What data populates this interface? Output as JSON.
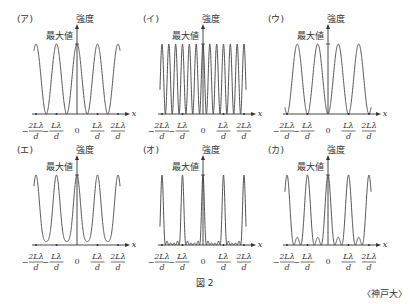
{
  "figure": {
    "caption": "図 2",
    "source": "〈神戸大〉",
    "y_label": "強度",
    "max_label": "最大値",
    "x_label": "x",
    "ticks": [
      "-2Lλ/d",
      "-Lλ/d",
      "0",
      "Lλ/d",
      "2Lλ/d"
    ],
    "ticks_display": {
      "neg2_num": "2Lλ",
      "neg1_num": "Lλ",
      "zero": "0",
      "pos1_num": "Lλ",
      "pos2_num": "2Lλ",
      "den": "d",
      "minus": "−"
    }
  },
  "panels": [
    {
      "id": "a",
      "label": "(ア)",
      "description": "cos² fringes, period Lλ/d, max at 0"
    },
    {
      "id": "i",
      "label": "(イ)",
      "description": "dense fringes, period Lλ/(3d), all equal maxima"
    },
    {
      "id": "u",
      "label": "(ウ)",
      "description": "fringes period Lλ/d, maxima shifted by half period (min at 0)"
    },
    {
      "id": "e",
      "label": "(エ)",
      "description": "main maxima at multiples of Lλ/d with one strong sidelobe pair"
    },
    {
      "id": "o",
      "label": "(オ)",
      "description": "sharp principal maxima with small subsidiary maxima"
    },
    {
      "id": "ka",
      "label": "(カ)",
      "description": "principal maxima with two secondary peaks of ~40% between"
    }
  ],
  "chart_data": [
    {
      "type": "line",
      "title": "(ア)",
      "xlabel": "x",
      "ylabel": "強度",
      "x_ticks": [
        "-2Lλ/d",
        "-Lλ/d",
        "0",
        "Lλ/d",
        "2Lλ/d"
      ],
      "pattern": "I = cos²(π x d / Lλ)",
      "maxima_x": [
        -2,
        -1,
        0,
        1,
        2
      ],
      "minima_x": [
        -1.5,
        -0.5,
        0.5,
        1.5
      ],
      "ymax": "最大値"
    },
    {
      "type": "line",
      "title": "(イ)",
      "xlabel": "x",
      "ylabel": "強度",
      "x_ticks": [
        "-2Lλ/d",
        "-Lλ/d",
        "0",
        "Lλ/d",
        "2Lλ/d"
      ],
      "pattern": "equal narrow fringes, ~13 peaks across range",
      "ymax": "最大値"
    },
    {
      "type": "line",
      "title": "(ウ)",
      "xlabel": "x",
      "ylabel": "強度",
      "x_ticks": [
        "-2Lλ/d",
        "-Lλ/d",
        "0",
        "Lλ/d",
        "2Lλ/d"
      ],
      "pattern": "I = sin²(π x d / Lλ)",
      "maxima_x": [
        -1.5,
        -0.5,
        0.5,
        1.5
      ],
      "minima_x": [
        -2,
        -1,
        0,
        1,
        2
      ],
      "ymax": "最大値"
    },
    {
      "type": "line",
      "title": "(エ)",
      "xlabel": "x",
      "ylabel": "強度",
      "x_ticks": [
        "-2Lλ/d",
        "-Lλ/d",
        "0",
        "Lλ/d",
        "2Lλ/d"
      ],
      "pattern": "principal maxima at integers, secondary maxima ~0.55 of max, zeros at ±0.5, ±1.5",
      "ymax": "最大値"
    },
    {
      "type": "line",
      "title": "(オ)",
      "xlabel": "x",
      "ylabel": "強度",
      "x_ticks": [
        "-2Lλ/d",
        "-Lλ/d",
        "0",
        "Lλ/d",
        "2Lλ/d"
      ],
      "pattern": "sharp principal maxima at integers, tiny ripples between",
      "ymax": "最大値"
    },
    {
      "type": "line",
      "title": "(カ)",
      "xlabel": "x",
      "ylabel": "強度",
      "x_ticks": [
        "-2Lλ/d",
        "-Lλ/d",
        "0",
        "Lλ/d",
        "2Lλ/d"
      ],
      "pattern": "principal maxima at integers, two secondary peaks (~0.3 of max) between each",
      "ymax": "最大値"
    }
  ]
}
